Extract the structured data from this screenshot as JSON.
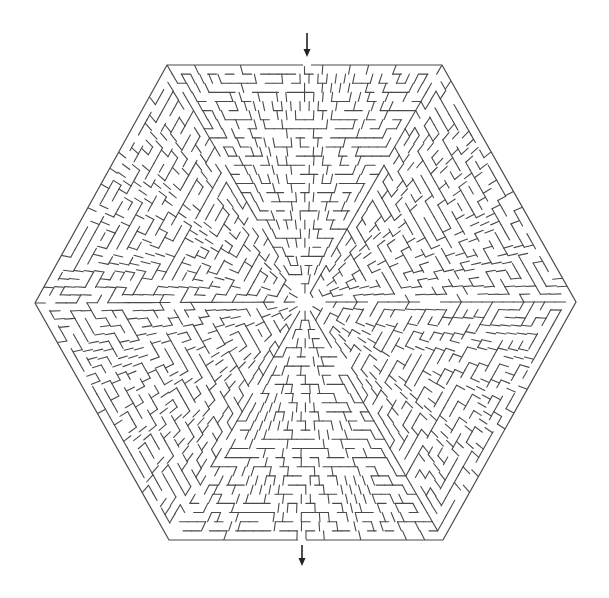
{
  "puzzle": {
    "type": "hexagonal-maze",
    "description": "Hexagonal maze with entrance at top and exit at bottom",
    "canvas": {
      "width": 609,
      "height": 598,
      "background": "#ffffff"
    },
    "colors": {
      "wall": "#4a4a4a",
      "arrow": "#222222"
    },
    "hexagon": {
      "vertices": [
        [
          167,
          65
        ],
        [
          442,
          65
        ],
        [
          576,
          302
        ],
        [
          443,
          540
        ],
        [
          169,
          540
        ],
        [
          35,
          303
        ]
      ],
      "center": [
        305,
        302
      ]
    },
    "entrance": {
      "label": "Start",
      "gap_x": [
        303,
        311
      ],
      "edge_y": 65,
      "arrow": {
        "x": 307,
        "y1": 33,
        "y2": 57,
        "direction": "down"
      }
    },
    "exit": {
      "label": "Finish",
      "gap_x": [
        298,
        306
      ],
      "edge_y": 540,
      "arrow": {
        "x": 302,
        "y1": 545,
        "y2": 566,
        "direction": "down"
      }
    },
    "grid": {
      "cell": 9.2,
      "seed": 7319,
      "sectors": 6
    }
  }
}
